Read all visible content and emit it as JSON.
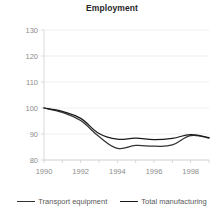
{
  "chart_data": {
    "type": "line",
    "title": "Employment",
    "xlabel": "",
    "ylabel": "",
    "xlim": [
      1990,
      1999
    ],
    "ylim": [
      80,
      130
    ],
    "grid": true,
    "legend_position": "bottom",
    "x": [
      1990,
      1991,
      1992,
      1993,
      1994,
      1995,
      1996,
      1997,
      1998,
      1999
    ],
    "xticks": [
      "1990",
      "1992",
      "1994",
      "1996",
      "1998"
    ],
    "xtick_values": [
      1990,
      1992,
      1994,
      1996,
      1998
    ],
    "yticks": [
      "80",
      "90",
      "100",
      "110",
      "120",
      "130"
    ],
    "ytick_values": [
      80,
      90,
      100,
      110,
      120,
      130
    ],
    "series": [
      {
        "name": "Transport equipment",
        "color": "#333333",
        "values": [
          100.0,
          98.3,
          95.2,
          89.0,
          84.5,
          85.6,
          85.3,
          85.8,
          89.4,
          88.4
        ]
      },
      {
        "name": "Total manufacturing",
        "color": "#1a1a1a",
        "values": [
          100.0,
          98.7,
          96.0,
          90.2,
          88.0,
          88.4,
          87.8,
          88.3,
          89.8,
          88.6
        ]
      }
    ]
  },
  "legend": {
    "items": [
      {
        "label": "Transport equipment"
      },
      {
        "label": "Total manufacturing"
      }
    ]
  }
}
